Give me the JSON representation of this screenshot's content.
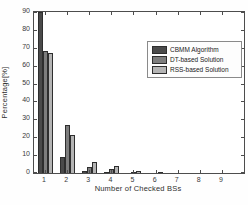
{
  "figure": {
    "background": "#ffffff",
    "axis_box_color": "#4d4d4d",
    "text_color": "#333333"
  },
  "chart_data": {
    "type": "bar",
    "title": "",
    "xlabel": "Number of Checked BSs",
    "ylabel": "Percentage[%]",
    "categories": [
      1,
      2,
      3,
      4,
      5,
      6,
      7,
      8,
      9
    ],
    "series": [
      {
        "name": "CBMM Algorithm",
        "color": "#4a4a4a",
        "values": [
          90,
          9,
          1,
          0.5,
          0,
          0,
          0,
          0,
          0
        ]
      },
      {
        "name": "DT-based Solution",
        "color": "#7d7d7d",
        "values": [
          68,
          27,
          3.5,
          2,
          0.5,
          0,
          0,
          0,
          0
        ]
      },
      {
        "name": "RSS-based Solution",
        "color": "#b4b4b4",
        "values": [
          67,
          21,
          6,
          4,
          1,
          0.5,
          0,
          0,
          0
        ]
      }
    ],
    "ylim": [
      0,
      90
    ],
    "ytick_step": 10,
    "xlim": [
      0.5,
      10.0
    ],
    "grid": false,
    "legend_position": "upper right"
  }
}
